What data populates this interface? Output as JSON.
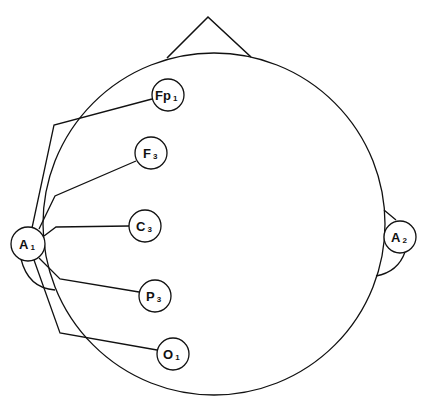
{
  "diagram": {
    "colors": {
      "stroke": "#111111",
      "background": "#ffffff"
    },
    "head": {
      "cx": 214,
      "cy": 224,
      "r": 171
    },
    "nose": {
      "apex": [
        208,
        17
      ],
      "left": [
        167,
        58
      ],
      "right": [
        251,
        57
      ]
    },
    "electrodes": [
      {
        "id": "Fp1",
        "letter": "Fp",
        "sub": "1",
        "cx": 168,
        "cy": 95
      },
      {
        "id": "F3",
        "letter": "F",
        "sub": "3",
        "cx": 151,
        "cy": 153
      },
      {
        "id": "C3",
        "letter": "C",
        "sub": "3",
        "cx": 145,
        "cy": 226
      },
      {
        "id": "P3",
        "letter": "P",
        "sub": "3",
        "cx": 155,
        "cy": 296
      },
      {
        "id": "O1",
        "letter": "O",
        "sub": "1",
        "cx": 173,
        "cy": 354
      },
      {
        "id": "A1",
        "letter": "A",
        "sub": "1",
        "cx": 28,
        "cy": 244
      },
      {
        "id": "A2",
        "letter": "A",
        "sub": "2",
        "cx": 400,
        "cy": 237
      }
    ],
    "connections": [
      "Fp1-A1",
      "F3-A1",
      "C3-A1",
      "P3-A1",
      "O1-A1"
    ]
  }
}
